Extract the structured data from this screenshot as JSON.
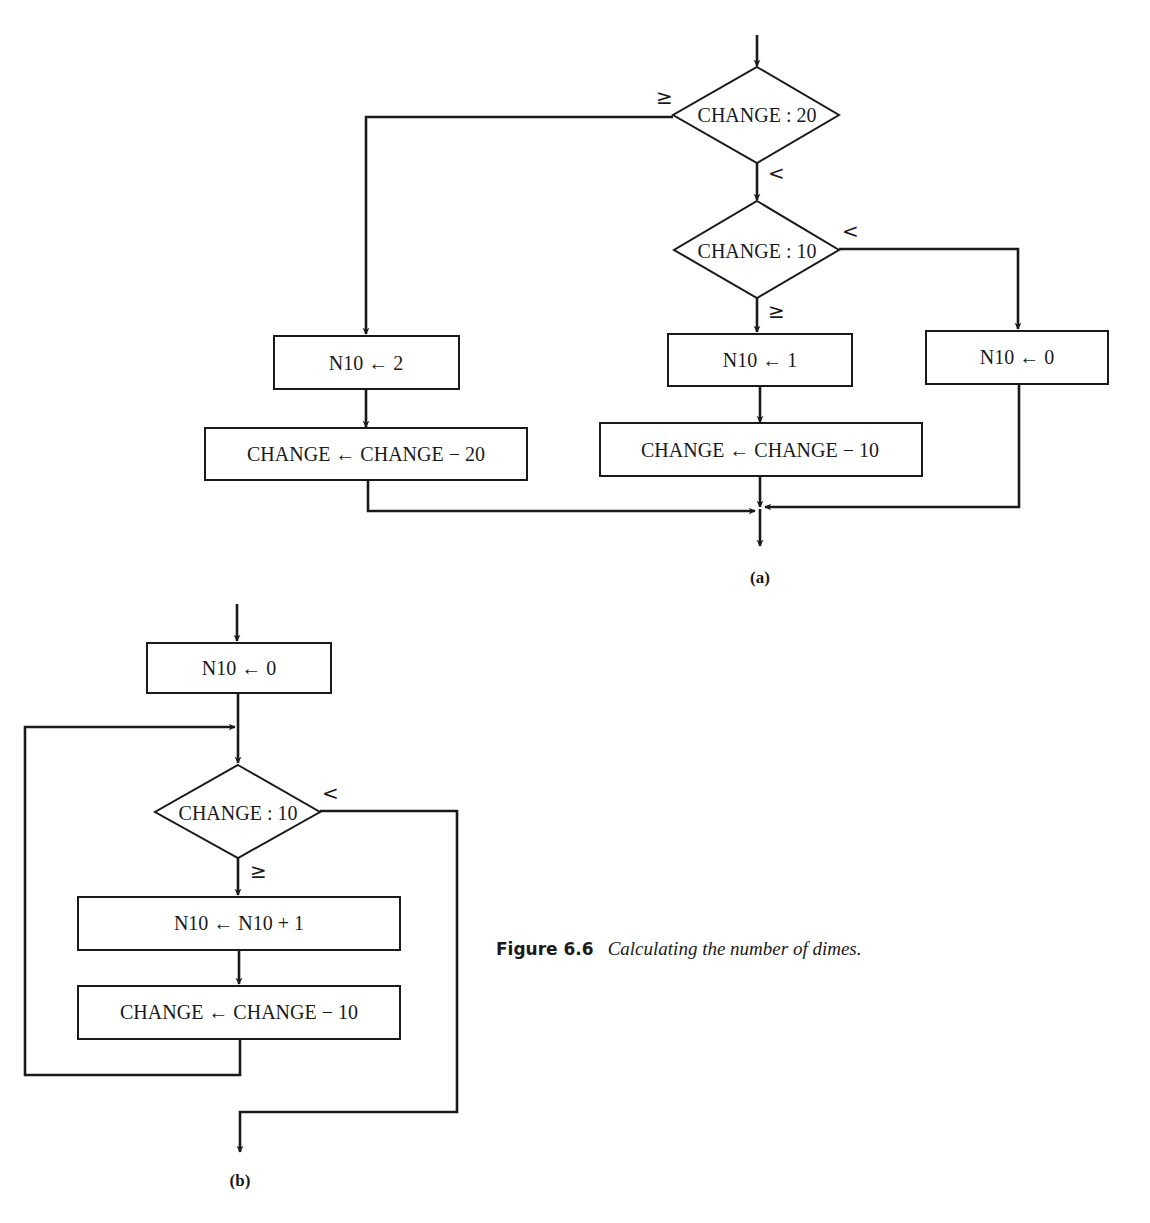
{
  "figure": {
    "number": "Figure 6.6",
    "title": "Calculating the number of dimes."
  },
  "diagram_a": {
    "label": "(a)",
    "decision_20": {
      "text": "CHANGE : 20",
      "branch_ge": "≥",
      "branch_lt": "<"
    },
    "decision_10": {
      "text": "CHANGE : 10",
      "branch_ge": "≥",
      "branch_lt": "<"
    },
    "box_n10_2": "N10 ← 2",
    "box_change_minus_20": "CHANGE ← CHANGE − 20",
    "box_n10_1": "N10 ← 1",
    "box_change_minus_10": "CHANGE ← CHANGE − 10",
    "box_n10_0": "N10 ← 0"
  },
  "diagram_b": {
    "label": "(b)",
    "box_init": "N10 ← 0",
    "decision_10": {
      "text": "CHANGE : 10",
      "branch_ge": "≥",
      "branch_lt": "<"
    },
    "box_increment": "N10 ← N10 + 1",
    "box_change_minus_10": "CHANGE ← CHANGE − 10"
  }
}
